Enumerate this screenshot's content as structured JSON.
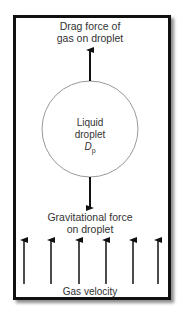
{
  "diagram": {
    "labels": {
      "drag": [
        "Drag force of",
        "gas on droplet"
      ],
      "droplet": [
        "Liquid",
        "droplet"
      ],
      "diameter_symbol": "D",
      "diameter_subscript": "p",
      "gravity": [
        "Gravitational force",
        "on droplet"
      ],
      "gas_velocity": "Gas velocity"
    },
    "gas_velocity_arrow_count": 6,
    "colors": {
      "border": "#111111",
      "circle": "#999999",
      "arrow": "#111111"
    }
  }
}
